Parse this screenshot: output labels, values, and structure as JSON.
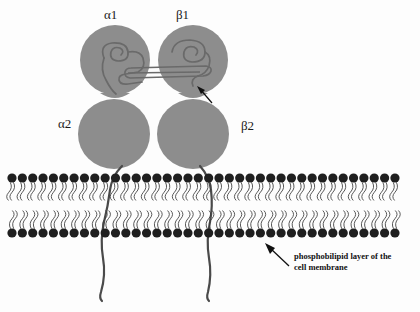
{
  "figure": {
    "type": "biology-diagram",
    "background_color": "#fdfdfd"
  },
  "receptor": {
    "subunit_fill": "#8d8d8d",
    "subunits": [
      {
        "id": "alpha1",
        "label": "α1",
        "position": "upper-left"
      },
      {
        "id": "beta1",
        "label": "β1",
        "position": "upper-right"
      },
      {
        "id": "alpha2",
        "label": "α2",
        "position": "lower-left"
      },
      {
        "id": "beta2",
        "label": "β2",
        "position": "lower-right"
      }
    ]
  },
  "membrane": {
    "head_color": "#1f1f1f",
    "tail_color": "#3a3a3a",
    "head_count": 38,
    "caption_line1": "phosphobilipid layer of the",
    "caption_line2": "cell membrane"
  },
  "annotations": {
    "binding_site_arrow": "arrow pointing to ligand binding region on β1",
    "membrane_arrow": "arrow pointing to the phospholipid bilayer"
  }
}
